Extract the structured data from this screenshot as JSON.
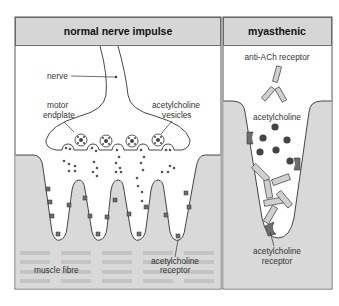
{
  "panels": [
    {
      "title": "normal nerve impulse",
      "labels": {
        "nerve": "nerve",
        "motor_endplate_1": "motor",
        "motor_endplate_2": "endplate",
        "vesicles_1": "acetylcholine",
        "vesicles_2": "vesicles",
        "muscle_fibre": "muscle fibre",
        "receptor_1": "acetylcholine",
        "receptor_2": "receptor"
      }
    },
    {
      "title": "myasthenic",
      "labels": {
        "antibody": "anti-ACh receptor",
        "acetylcholine": "acetylcholine",
        "receptor_1": "acetylcholine",
        "receptor_2": "receptor"
      }
    }
  ],
  "colors": {
    "header_bg": "#d6d6d6",
    "muscle_bg": "#d9d9d9",
    "stripe": "#c6c6c6",
    "outline": "#333333",
    "receptor_dark": "#6e6e6e",
    "dot": "#555555"
  }
}
